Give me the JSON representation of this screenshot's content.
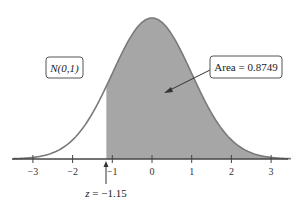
{
  "chart_data": {
    "type": "area",
    "title": "",
    "distribution": "N(0,1)",
    "xlabel": "",
    "ylabel": "",
    "xlim": [
      -3.5,
      3.5
    ],
    "x_ticks": [
      -3,
      -2,
      -1,
      0,
      1,
      2,
      3
    ],
    "x_tick_labels": [
      "−3",
      "−2",
      "−1",
      "0",
      "1",
      "2",
      "3"
    ],
    "shaded_region": {
      "from": -1.15,
      "to": 3.5
    },
    "annotations": {
      "distribution_label": "N(0,1)",
      "area_label": "Area = 0.8749",
      "z_label": "z = −1.15"
    },
    "area": 0.8749,
    "z": -1.15,
    "grid": false,
    "colors": {
      "shade": "#a6a6a6",
      "curve": "#7a7a7a",
      "axis": "#444444"
    }
  }
}
